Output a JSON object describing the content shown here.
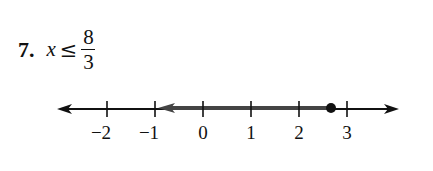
{
  "problem": {
    "number": "7.",
    "variable": "x",
    "relation": "≤",
    "numerator": "8",
    "denominator": "3"
  },
  "number_line": {
    "ticks": [
      {
        "value": -2,
        "label": "−2"
      },
      {
        "value": -1,
        "label": "−1"
      },
      {
        "value": 0,
        "label": "0"
      },
      {
        "value": 1,
        "label": "1"
      },
      {
        "value": 2,
        "label": "2"
      },
      {
        "value": 3,
        "label": "3"
      }
    ],
    "closed_point": 2.667,
    "shaded_direction": "left",
    "colors": {
      "ink": "#111111",
      "shade": "#555555"
    }
  }
}
